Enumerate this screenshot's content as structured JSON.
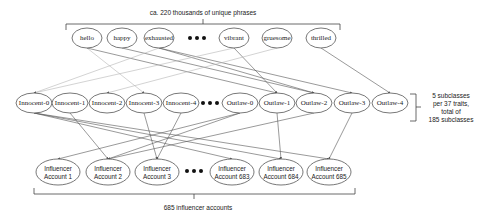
{
  "top_annotation": "ca. 220 thousands of unique phrases",
  "right_annotation": [
    "5 subclasses",
    "per 37 traits,",
    "total of",
    "185 subclasses"
  ],
  "bottom_annotation": "685 influencer accounts",
  "ellipsis_icon": "three-dots",
  "phrases": [
    {
      "label": "hello",
      "x": 87,
      "y": 38
    },
    {
      "label": "happy",
      "x": 122,
      "y": 38
    },
    {
      "label": "exhausted",
      "x": 159,
      "y": 38
    },
    {
      "label": "vibrant",
      "x": 234,
      "y": 38
    },
    {
      "label": "gruesome",
      "x": 277,
      "y": 38
    },
    {
      "label": "thrilled",
      "x": 321,
      "y": 38
    }
  ],
  "subclasses": [
    {
      "label": "Innocent-0",
      "x": 34,
      "y": 103
    },
    {
      "label": "Innocent-1",
      "x": 70,
      "y": 103
    },
    {
      "label": "Innocent-2",
      "x": 107,
      "y": 103
    },
    {
      "label": "Innocent-3",
      "x": 144,
      "y": 103
    },
    {
      "label": "Innocent-4",
      "x": 181,
      "y": 103
    },
    {
      "label": "Outlaw-0",
      "x": 240,
      "y": 103
    },
    {
      "label": "Outlaw-1",
      "x": 277,
      "y": 103
    },
    {
      "label": "Outlaw-2",
      "x": 314,
      "y": 103
    },
    {
      "label": "Outlaw-3",
      "x": 352,
      "y": 103
    },
    {
      "label": "Outlaw-4",
      "x": 390,
      "y": 103
    }
  ],
  "accounts": [
    {
      "line1": "Influencer",
      "line2": "Account 1",
      "x": 58,
      "y": 172
    },
    {
      "line1": "Influencer",
      "line2": "Account 2",
      "x": 108,
      "y": 172
    },
    {
      "line1": "Influencer",
      "line2": "Account 3",
      "x": 157,
      "y": 172
    },
    {
      "line1": "Influencer",
      "line2": "Account 683",
      "x": 232,
      "y": 172
    },
    {
      "line1": "Influencer",
      "line2": "Account 684",
      "x": 281,
      "y": 172
    },
    {
      "line1": "Influencer",
      "line2": "Account 685",
      "x": 329,
      "y": 172
    }
  ],
  "edges_top": [
    {
      "from": 0,
      "to": 3,
      "style": "light"
    },
    {
      "from": 0,
      "to": 6,
      "style": "dark"
    },
    {
      "from": 1,
      "to": 7,
      "style": "dark"
    },
    {
      "from": 2,
      "to": 0,
      "style": "light"
    },
    {
      "from": 2,
      "to": 7,
      "style": "dark"
    },
    {
      "from": 2,
      "to": 8,
      "style": "dark"
    },
    {
      "from": 3,
      "to": 6,
      "style": "dark"
    },
    {
      "from": 3,
      "to": 0,
      "style": "light"
    },
    {
      "from": 4,
      "to": 2,
      "style": "light"
    },
    {
      "from": 5,
      "to": 9,
      "style": "dark"
    }
  ],
  "edges_bottom": [
    {
      "from": 0,
      "to": 3
    },
    {
      "from": 0,
      "to": 4
    },
    {
      "from": 1,
      "to": 1
    },
    {
      "from": 3,
      "to": 2
    },
    {
      "from": 4,
      "to": 2
    },
    {
      "from": 5,
      "to": 0
    },
    {
      "from": 5,
      "to": 1
    },
    {
      "from": 6,
      "to": 4
    },
    {
      "from": 7,
      "to": 1
    },
    {
      "from": 0,
      "to": 5
    },
    {
      "from": 8,
      "to": 5
    }
  ]
}
